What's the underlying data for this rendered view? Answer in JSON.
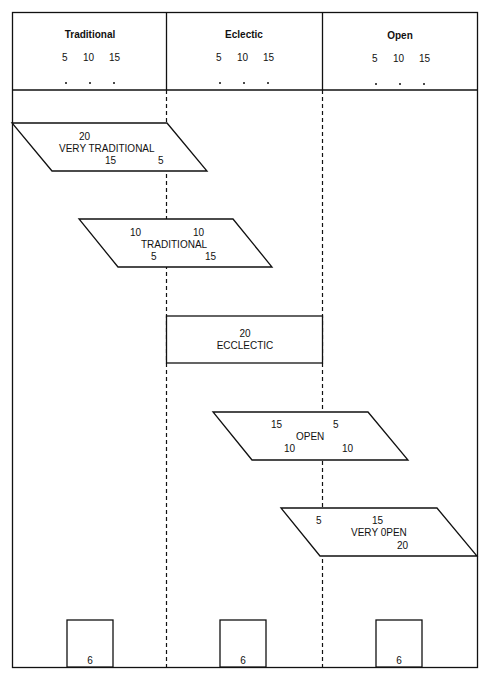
{
  "columns": [
    {
      "title": "Traditional",
      "scale": [
        "5",
        "10",
        "15"
      ],
      "bottom_box": "6"
    },
    {
      "title": "Eclectic",
      "scale": [
        "5",
        "10",
        "15"
      ],
      "bottom_box": "6"
    },
    {
      "title": "Open",
      "scale": [
        "5",
        "10",
        "15"
      ],
      "bottom_box": "6"
    }
  ],
  "shapes": {
    "very_traditional": {
      "label": "VERY TRADITIONAL",
      "top": "20",
      "bottom_left": "15",
      "bottom_right": "5"
    },
    "traditional": {
      "label": "TRADITIONAL",
      "top_left": "10",
      "top_right": "10",
      "bottom_left": "5",
      "bottom_right": "15"
    },
    "ecclectic": {
      "label": "ECCLECTIC",
      "top": "20"
    },
    "open": {
      "label": "OPEN",
      "top_left": "15",
      "top_right": "5",
      "bottom_left": "10",
      "bottom_right": "10"
    },
    "very_open": {
      "label": "VERY 0PEN",
      "top_left": "5",
      "top_right": "15",
      "bottom_right": "20"
    }
  }
}
